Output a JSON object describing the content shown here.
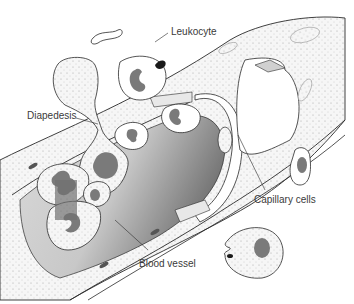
{
  "diagram": {
    "labels": {
      "leukocyte": "Leukocyte",
      "diapedesis": "Diapedesis",
      "capillary_cells": "Capillary cells",
      "blood_vessel": "Blood vessel"
    },
    "colors": {
      "outline": "#2a2a2a",
      "nucleus": "#7a7a7a",
      "lumen_dark": "#8a8a8a",
      "lumen_light": "#d8d8d8",
      "cell_fill": "#f4f4f4",
      "background": "#ffffff"
    }
  }
}
